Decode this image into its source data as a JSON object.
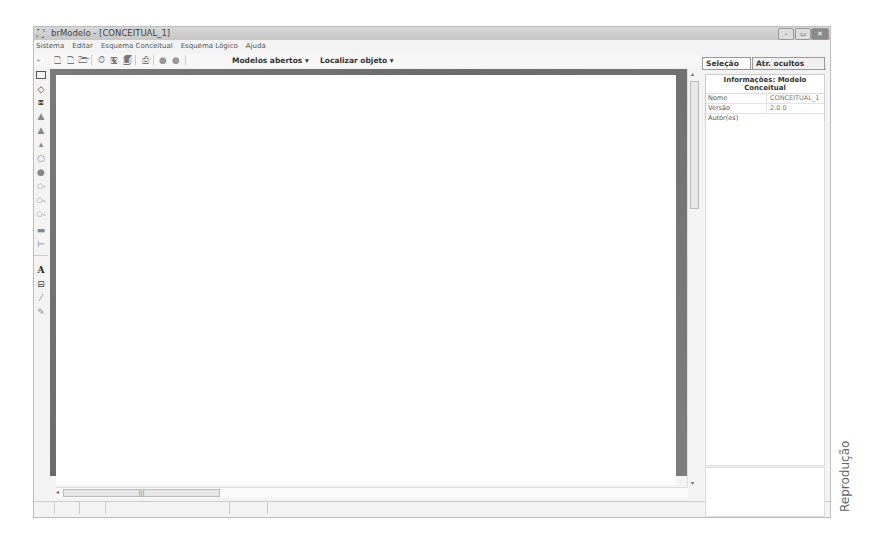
{
  "window": {
    "title": "brModelo - [CONCEITUAL_1]",
    "controls": {
      "minimize": "–",
      "maximize": "▭",
      "close": "✕"
    }
  },
  "menu": {
    "items": [
      "Sistema",
      "Editar",
      "Esquema Conceitual",
      "Esquema Lógico",
      "Ajuda"
    ]
  },
  "toolbar": {
    "buttons": [
      "new-conceptual-icon",
      "new-logical-icon",
      "open-icon",
      "timer-icon",
      "save-icon",
      "save-as-icon",
      "print-icon",
      "back-icon",
      "forward-icon"
    ],
    "models_dropdown": "Modelos abertos",
    "find_dropdown": "Localizar objeto"
  },
  "palette": {
    "tools": [
      "pointer",
      "entity",
      "relationship",
      "associative-entity",
      "specialization",
      "specialization-exclusive",
      "specialization-optional",
      "attribute",
      "identifier-attribute",
      "compound-attribute",
      "optional-attribute",
      "multivalued-attribute",
      "link",
      "self-relationship",
      "text",
      "comment",
      "eraser",
      "brush"
    ]
  },
  "canvas": {
    "hscroll_label": "|||"
  },
  "right_panel": {
    "tabs": [
      {
        "label": "Seleção",
        "active": true
      },
      {
        "label": "Atr. ocultos",
        "active": false
      }
    ],
    "info_title": "Informações: Modelo Conceitual",
    "properties": [
      {
        "key": "Nome",
        "value": "CONCEITUAL_1"
      },
      {
        "key": "Versão",
        "value": "2.0.0"
      },
      {
        "key": "Autor(es)",
        "value": ""
      },
      {
        "key": "Observações",
        "value": ""
      }
    ]
  },
  "credit": "Reprodução"
}
